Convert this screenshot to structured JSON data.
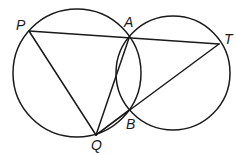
{
  "diagram": {
    "type": "geometry",
    "stroke_color": "#1a1a1a",
    "background": "#ffffff",
    "circles": [
      {
        "name": "left-circle",
        "cx": 77,
        "cy": 73,
        "r": 64
      },
      {
        "name": "right-circle",
        "cx": 173,
        "cy": 73,
        "r": 57
      }
    ],
    "points": {
      "P": {
        "label": "P",
        "x": 29,
        "y": 31,
        "lx": 16,
        "ly": 30
      },
      "A": {
        "label": "A",
        "x": 129,
        "y": 38,
        "lx": 124,
        "ly": 27
      },
      "T": {
        "label": "T",
        "x": 219,
        "y": 44,
        "lx": 224,
        "ly": 44
      },
      "B": {
        "label": "B",
        "x": 129,
        "y": 110,
        "lx": 126,
        "ly": 129
      },
      "Q": {
        "label": "Q",
        "x": 96,
        "y": 135,
        "lx": 91,
        "ly": 150
      }
    },
    "segments": [
      {
        "name": "segment-PT",
        "from": "P",
        "to": "T"
      },
      {
        "name": "segment-PQ",
        "from": "P",
        "to": "Q"
      },
      {
        "name": "segment-QA",
        "from": "Q",
        "to": "A"
      },
      {
        "name": "segment-QB",
        "from": "Q",
        "to": "B"
      },
      {
        "name": "segment-QT",
        "from": "Q",
        "to": "T"
      }
    ]
  }
}
